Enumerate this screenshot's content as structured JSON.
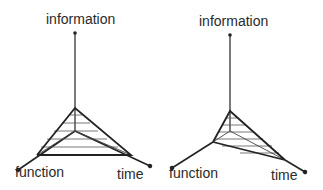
{
  "diagrams": [
    {
      "id": "left",
      "labels": {
        "top": "information",
        "left": "function",
        "right": "time"
      },
      "axis_color": "#222222",
      "hatch_color": "#555555"
    },
    {
      "id": "right",
      "labels": {
        "top": "information",
        "left": "function",
        "right": "time"
      },
      "axis_color": "#222222",
      "hatch_color": "#555555"
    }
  ]
}
